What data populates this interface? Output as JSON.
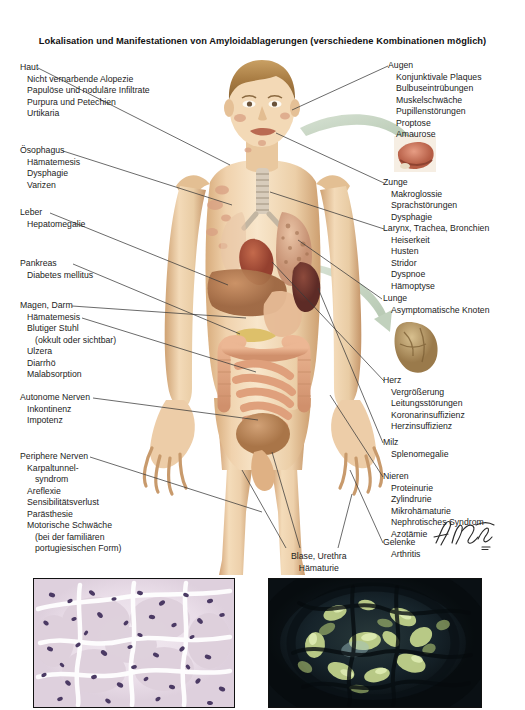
{
  "document": {
    "title": "Lokalisation und Manifestationen von Amyloidablagerungen (verschiedene Kombinationen möglich)",
    "artist_signature": "F. Netter",
    "background_color": "#ffffff",
    "text_color": "#1c1c1c",
    "leader_line_color": "#3a3a3a",
    "arrow_color": "#c3d2c0"
  },
  "labels_left": [
    {
      "id": "haut",
      "heading": "Haut",
      "items": [
        "Nicht vernarbende Alopezie",
        "Papulöse und noduläre Infiltrate",
        "Purpura und Petechien",
        "Urtikaria"
      ]
    },
    {
      "id": "oesophagus",
      "heading": "Ösophagus",
      "items": [
        "Hämatemesis",
        "Dysphagie",
        "Varizen"
      ]
    },
    {
      "id": "leber",
      "heading": "Leber",
      "items": [
        "Hepatomegalie"
      ]
    },
    {
      "id": "pankreas",
      "heading": "Pankreas",
      "items": [
        "Diabetes mellitus"
      ]
    },
    {
      "id": "magen-darm",
      "heading": "Magen, Darm",
      "items": [
        "Hämatemesis",
        "Blutiger Stuhl",
        "(okkult oder sichtbar)",
        "Ulzera",
        "Diarrhö",
        "Malabsorption"
      ],
      "indented_items": [
        "(okkult oder sichtbar)"
      ]
    },
    {
      "id": "autonome-nerven",
      "heading": "Autonome Nerven",
      "items": [
        "Inkontinenz",
        "Impotenz"
      ]
    },
    {
      "id": "periphere-nerven",
      "heading": "Periphere Nerven",
      "items": [
        "Karpaltunnel-",
        "syndrom",
        "Areflexie",
        "Sensibilitätsverlust",
        "Parästhesie",
        "Motorische Schwäche",
        "(bei der familiären",
        "portugiesischen Form)"
      ],
      "indented_items": [
        "syndrom",
        "(bei der familiären",
        "portugiesischen Form)"
      ]
    }
  ],
  "labels_right": [
    {
      "id": "augen",
      "heading": "Augen",
      "items": [
        "Konjunktivale Plaques",
        "Bulbuseintrübungen",
        "Muskelschwäche",
        "Pupillenstörungen",
        "Proptose",
        "Amaurose"
      ]
    },
    {
      "id": "zunge",
      "heading": "Zunge",
      "items": [
        "Makroglossie",
        "Sprachstörungen",
        "Dysphagie"
      ]
    },
    {
      "id": "larynx",
      "heading": "Larynx, Trachea, Bronchien",
      "items": [
        "Heiserkeit",
        "Husten",
        "Stridor",
        "Dyspnoe",
        "Hämoptyse"
      ]
    },
    {
      "id": "lunge",
      "heading": "Lunge",
      "items": [
        "Asymptomatische Knoten"
      ]
    },
    {
      "id": "herz",
      "heading": "Herz",
      "items": [
        "Vergrößerung",
        "Leitungsstörungen",
        "Koronarinsuffizienz",
        "Herzinsuffizienz"
      ]
    },
    {
      "id": "milz",
      "heading": "Milz",
      "items": [
        "Splenomegalie"
      ]
    },
    {
      "id": "nieren",
      "heading": "Nieren",
      "items": [
        "Proteinurie",
        "Zylindrurie",
        "Mikrohämaturie",
        "Nephrotisches Syndrom",
        "Azotämie"
      ]
    },
    {
      "id": "gelenke",
      "heading": "Gelenke",
      "items": [
        "Arthritis"
      ]
    }
  ],
  "labels_bottom": [
    {
      "id": "blase-urethra",
      "heading": "Blase, Urethra",
      "items": [
        "Hämaturie"
      ]
    }
  ],
  "insets": [
    {
      "id": "tongue-inset",
      "name": "tongue-macroglossia-inset"
    },
    {
      "id": "heart-inset",
      "name": "heart-amyloid-inset"
    }
  ],
  "photos": [
    {
      "id": "photo-left",
      "name": "histology-he-stain",
      "description": "Glomerulus, H&E-Färbung",
      "palette": [
        "#efe6ee",
        "#e2d3e0",
        "#d9c7d6",
        "#4a3b63",
        "#ffffff"
      ]
    },
    {
      "id": "photo-right",
      "name": "histology-congo-red-polarized",
      "description": "Kongorot unter polarisiertem Licht, apfelgrüne Doppelbrechung",
      "palette": [
        "#10161a",
        "#1d2a2c",
        "#b9c98c",
        "#d6e3a8",
        "#8fa86e"
      ]
    }
  ],
  "figure": {
    "name": "male-anatomical-figure",
    "skin_light": "#f4ddc0",
    "skin_mid": "#e8c69c",
    "skin_shadow": "#c9a173",
    "organ_liver": "#b07a55",
    "organ_spleen": "#7e4338",
    "organ_intestine": "#e0a98a",
    "organ_lung": "#d8a98c",
    "organ_heart": "#b5553f"
  }
}
